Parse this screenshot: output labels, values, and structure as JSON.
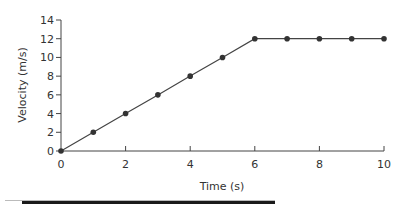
{
  "chart_data": {
    "type": "line",
    "title": "",
    "xlabel": "Time (s)",
    "ylabel": "Velocity (m/s)",
    "x": [
      0,
      1,
      2,
      3,
      4,
      5,
      6,
      7,
      8,
      9,
      10
    ],
    "series": [
      {
        "name": "Velocity",
        "values": [
          0,
          2,
          4,
          6,
          8,
          10,
          12,
          12,
          12,
          12,
          12
        ]
      }
    ],
    "xlim": [
      0,
      10
    ],
    "ylim": [
      0,
      14
    ],
    "xticks": [
      0,
      2,
      4,
      6,
      8,
      10
    ],
    "yticks": [
      0,
      2,
      4,
      6,
      8,
      10,
      12,
      14
    ],
    "grid": false,
    "legend": "none",
    "colors": {
      "line": "#444444",
      "marker": "#333333",
      "axis": "#444444"
    }
  }
}
